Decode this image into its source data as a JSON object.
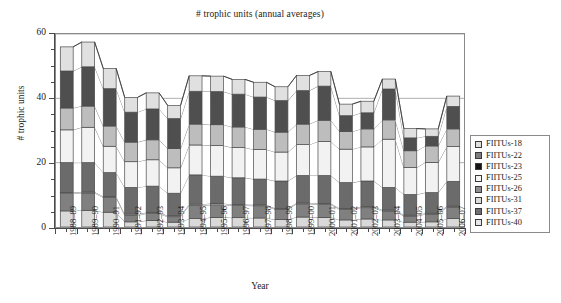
{
  "chart_data": {
    "type": "area",
    "stacked": true,
    "title": "# trophic units (annual averages)",
    "xlabel": "Year",
    "ylabel": "# trophic units",
    "ylim": [
      0,
      60
    ],
    "ytick_major": [
      0,
      20,
      40,
      60
    ],
    "ytick_minor_step": 5,
    "grid": true,
    "legend_position": "right",
    "categories": [
      "1988–89",
      "1989–90",
      "1990–91",
      "1991–92",
      "1992–93",
      "1993–94",
      "1994–95",
      "1995–96",
      "1996–97",
      "1997–98",
      "1998–99",
      "1999–00",
      "2000–01",
      "2001–02",
      "2002–03",
      "2003–04",
      "2004–05",
      "2005–06",
      "2006–07"
    ],
    "series": [
      {
        "name": "FIITUs-40",
        "fill": "#d9d9d9",
        "values": [
          5.0,
          5.2,
          4.6,
          1.6,
          2.0,
          1.5,
          2.6,
          3.0,
          2.9,
          2.8,
          2.3,
          3.1,
          3.0,
          2.2,
          2.5,
          2.2,
          1.5,
          1.6,
          2.6
        ]
      },
      {
        "name": "FIITUs-37",
        "fill": "#808080",
        "values": [
          5.4,
          5.4,
          4.6,
          2.0,
          2.2,
          1.7,
          4.1,
          3.9,
          3.8,
          3.8,
          3.2,
          4.1,
          4.0,
          3.3,
          3.5,
          2.8,
          1.9,
          2.4,
          3.6
        ]
      },
      {
        "name": "FIITUs-31",
        "fill": "#e8e8e8",
        "values": [
          0.3,
          0.3,
          0.3,
          0.4,
          0.3,
          0.3,
          0.4,
          0.4,
          0.3,
          0.3,
          0.3,
          0.3,
          0.3,
          0.3,
          0.3,
          0.3,
          0.3,
          0.3,
          0.3
        ]
      },
      {
        "name": "FIITUs-26",
        "fill": "#6b6b6b",
        "values": [
          9.3,
          9.1,
          7.4,
          8.3,
          8.2,
          7.0,
          9.1,
          8.5,
          8.3,
          8.0,
          8.5,
          8.5,
          8.7,
          8.0,
          8.0,
          7.0,
          6.4,
          6.4,
          7.7
        ]
      },
      {
        "name": "FIITUs-25",
        "fill": "#f2f2f2",
        "values": [
          10.2,
          11.0,
          8.2,
          8.0,
          8.2,
          7.9,
          9.3,
          9.5,
          9.4,
          9.2,
          9.0,
          9.6,
          10.6,
          10.4,
          10.6,
          15.0,
          8.4,
          9.4,
          10.8
        ]
      },
      {
        "name": "FIITUs-23",
        "fill": "#bdbdbd",
        "values": [
          6.8,
          6.6,
          6.3,
          6.1,
          6.2,
          6.0,
          6.5,
          6.5,
          6.4,
          6.3,
          6.2,
          6.4,
          6.6,
          5.5,
          5.6,
          6.0,
          5.2,
          5.1,
          5.5
        ]
      },
      {
        "name": "FIITUs-22",
        "fill": "#4f4f4f",
        "values": [
          11.5,
          12.2,
          11.6,
          9.3,
          9.6,
          9.3,
          10.2,
          10.3,
          10.2,
          10.0,
          9.8,
          10.4,
          10.6,
          4.9,
          5.0,
          9.6,
          4.0,
          3.0,
          7.0
        ]
      },
      {
        "name": "FIITUs-18",
        "fill": "#e0e0e0",
        "values": [
          7.5,
          7.7,
          6.3,
          4.6,
          5.0,
          4.1,
          4.8,
          4.8,
          4.6,
          4.6,
          4.3,
          4.7,
          4.5,
          3.6,
          3.6,
          3.1,
          2.9,
          2.3,
          3.2
        ]
      }
    ],
    "totals": [
      56.0,
      57.5,
      49.3,
      40.3,
      41.7,
      37.8,
      47.0,
      46.9,
      45.9,
      45.0,
      43.6,
      47.1,
      48.3,
      38.2,
      39.1,
      46.0,
      30.6,
      30.5,
      40.7
    ]
  },
  "chart": {
    "title": "# trophic units (annual averages)",
    "y_axis_title": "# trophic units",
    "x_axis_title": "Year"
  },
  "legend": {
    "items": [
      {
        "label": "FIITUs-18",
        "swatch": "#e0e0e0"
      },
      {
        "label": "FIITUs-22",
        "swatch": "#7d7d7d"
      },
      {
        "label": "FIITUs-23",
        "swatch": "#141414"
      },
      {
        "label": "FIITUs-25",
        "swatch": "#f4f4f4"
      },
      {
        "label": "FIITUs-26",
        "swatch": "#8f8f8f"
      },
      {
        "label": "FIITUs-31",
        "swatch": "#dcdcdc"
      },
      {
        "label": "FIITUs-37",
        "swatch": "#6e6e6e"
      },
      {
        "label": "FIITUs-40",
        "swatch": "#e6e6e6"
      }
    ]
  }
}
